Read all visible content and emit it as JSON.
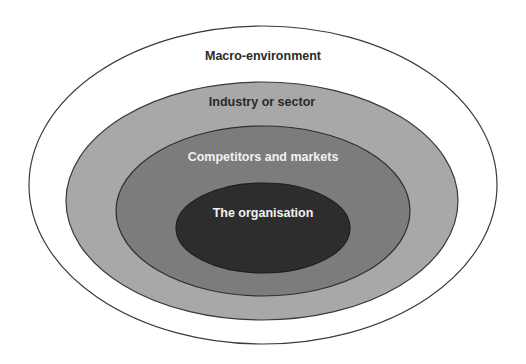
{
  "diagram": {
    "type": "nested-ellipses",
    "layers": [
      {
        "id": "macro",
        "label": "Macro-environment",
        "fill": "#ffffff",
        "text_color": "#2a2a2a",
        "stroke": "#3a3a3a",
        "cx": 263,
        "cy": 185,
        "rx": 234,
        "ry": 159,
        "label_y": 60
      },
      {
        "id": "industry",
        "label": "Industry or sector",
        "fill": "#a8a8a8",
        "text_color": "#2a2a2a",
        "stroke": "#3a3a3a",
        "cx": 262,
        "cy": 201,
        "rx": 196,
        "ry": 119,
        "label_y": 106
      },
      {
        "id": "competitors",
        "label": "Competitors and markets",
        "fill": "#7c7c7c",
        "text_color": "#f2f2f2",
        "stroke": "#2e2e2e",
        "cx": 263,
        "cy": 211,
        "rx": 147,
        "ry": 85,
        "label_y": 161
      },
      {
        "id": "organisation",
        "label": "The organisation",
        "fill": "#2d2d2d",
        "text_color": "#f2f2f2",
        "stroke": "#1e1e1e",
        "cx": 263,
        "cy": 228,
        "rx": 87,
        "ry": 45,
        "label_y": 217
      }
    ]
  }
}
